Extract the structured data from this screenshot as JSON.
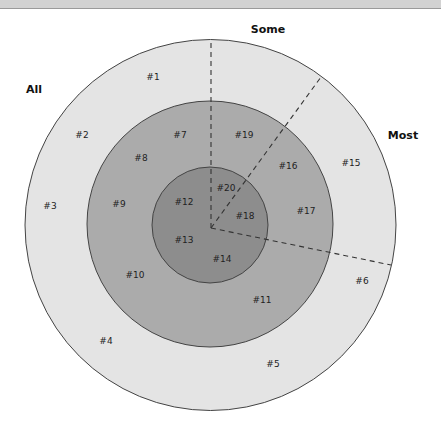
{
  "diagram": {
    "colors": {
      "outer_ring": "#e4e4e4",
      "middle_ring": "#ababab",
      "inner_ring": "#8d8d8d",
      "stroke": "#444444"
    },
    "categories": [
      {
        "id": "all",
        "label": "All",
        "x": 34,
        "y": 93
      },
      {
        "id": "some",
        "label": "Some",
        "x": 268,
        "y": 33
      },
      {
        "id": "most",
        "label": "Most",
        "x": 403,
        "y": 139
      }
    ],
    "items": [
      {
        "label": "#1",
        "x": 153,
        "y": 80
      },
      {
        "label": "#2",
        "x": 82,
        "y": 138
      },
      {
        "label": "#3",
        "x": 50,
        "y": 209
      },
      {
        "label": "#4",
        "x": 106,
        "y": 344
      },
      {
        "label": "#5",
        "x": 273,
        "y": 367
      },
      {
        "label": "#6",
        "x": 362,
        "y": 284
      },
      {
        "label": "#7",
        "x": 180,
        "y": 138
      },
      {
        "label": "#8",
        "x": 141,
        "y": 161
      },
      {
        "label": "#9",
        "x": 119,
        "y": 207
      },
      {
        "label": "#10",
        "x": 135,
        "y": 278
      },
      {
        "label": "#11",
        "x": 262,
        "y": 303
      },
      {
        "label": "#12",
        "x": 184,
        "y": 205
      },
      {
        "label": "#13",
        "x": 184,
        "y": 243
      },
      {
        "label": "#14",
        "x": 222,
        "y": 262
      },
      {
        "label": "#15",
        "x": 351,
        "y": 166
      },
      {
        "label": "#16",
        "x": 288,
        "y": 169
      },
      {
        "label": "#17",
        "x": 306,
        "y": 214
      },
      {
        "label": "#18",
        "x": 245,
        "y": 219
      },
      {
        "label": "#19",
        "x": 244,
        "y": 138
      },
      {
        "label": "#20",
        "x": 226,
        "y": 191
      }
    ]
  }
}
